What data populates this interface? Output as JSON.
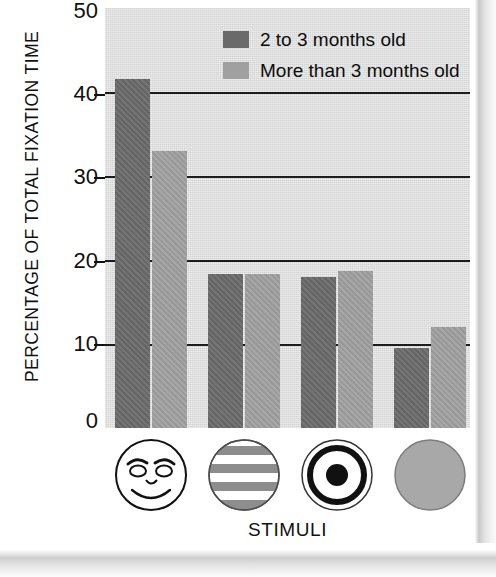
{
  "chart_data": {
    "type": "bar",
    "title": "",
    "xlabel": "STIMULI",
    "ylabel": "PERCENTAGE OF TOTAL FIXATION TIME",
    "ylim": [
      0,
      50
    ],
    "yticks": [
      0,
      10,
      20,
      30,
      40,
      50
    ],
    "gridlines": [
      10,
      20,
      30,
      40
    ],
    "grid": true,
    "legend_position": "top-center-inside",
    "categories": [
      "face",
      "stripes",
      "bullseye",
      "plain circle"
    ],
    "series": [
      {
        "name": "2 to 3 months old",
        "color": "#6a6a6a",
        "values": [
          41.5,
          18.3,
          18.0,
          9.5
        ]
      },
      {
        "name": "More than 3 months old",
        "color": "#a0a0a0",
        "values": [
          33.0,
          18.3,
          18.7,
          12.0
        ]
      }
    ]
  },
  "axis": {
    "y_title": "PERCENTAGE OF TOTAL FIXATION TIME",
    "x_title": "STIMULI",
    "tick_50": "50",
    "tick_40": "40",
    "tick_30": "30",
    "tick_20": "20",
    "tick_10": "10",
    "tick_0": "0"
  },
  "legend": {
    "items": [
      {
        "label": "2 to 3 months old",
        "color": "#6a6a6a"
      },
      {
        "label": "More than 3 months old",
        "color": "#a0a0a0"
      }
    ]
  },
  "stimuli": [
    {
      "name": "face-stimulus",
      "label": "face"
    },
    {
      "name": "stripes-stimulus",
      "label": "stripes"
    },
    {
      "name": "bullseye-stimulus",
      "label": "bullseye"
    },
    {
      "name": "plain-circle-stimulus",
      "label": "plain circle"
    }
  ],
  "colors": {
    "plot_background": "#dcdcdc",
    "page_background": "#ffffff",
    "grid": "#1c1c1c",
    "series_dark": "#6a6a6a",
    "series_light": "#a0a0a0",
    "text": "#111111"
  }
}
